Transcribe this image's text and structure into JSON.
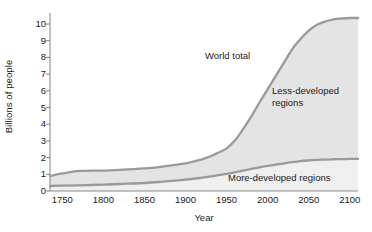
{
  "chart_data": {
    "type": "area",
    "title": "",
    "xlabel": "Year",
    "ylabel": "Billions of people",
    "xlim": [
      1735,
      2110
    ],
    "ylim": [
      0,
      10.6
    ],
    "grid": false,
    "legend_position": "inline-annotations",
    "xticks": [
      1750,
      1800,
      1850,
      1900,
      1950,
      2000,
      2050,
      2100
    ],
    "xtick_labels": [
      "1750",
      "1800",
      "1850",
      "1900",
      "1950",
      "2000",
      "2050",
      "2100"
    ],
    "yticks": [
      0,
      1,
      2,
      3,
      4,
      5,
      6,
      7,
      8,
      9,
      10
    ],
    "ytick_labels": [
      "0",
      "1",
      "2",
      "3",
      "4",
      "5",
      "6",
      "7",
      "8",
      "9",
      "10"
    ],
    "annotations": [
      {
        "text": "World total",
        "x": 1975,
        "y": 7.9
      },
      {
        "text": "Less-developed\nregions",
        "x": 2055,
        "y": 5.9
      },
      {
        "text": "More-developed regions",
        "x": 2020,
        "y": 1.0
      }
    ],
    "x": [
      1735,
      1750,
      1770,
      1800,
      1820,
      1850,
      1870,
      1900,
      1920,
      1930,
      1940,
      1950,
      1960,
      1970,
      1980,
      1990,
      2000,
      2010,
      2020,
      2030,
      2040,
      2050,
      2060,
      2070,
      2080,
      2090,
      2100,
      2110
    ],
    "series": [
      {
        "name": "World total",
        "color": "#9a9a9a",
        "values": [
          0.9,
          1.05,
          1.2,
          1.22,
          1.26,
          1.35,
          1.45,
          1.65,
          1.9,
          2.07,
          2.3,
          2.55,
          3.02,
          3.7,
          4.45,
          5.3,
          6.1,
          6.9,
          7.7,
          8.5,
          9.1,
          9.6,
          9.95,
          10.15,
          10.28,
          10.33,
          10.36,
          10.36
        ]
      },
      {
        "name": "More-developed regions",
        "color": "#9a9a9a",
        "values": [
          0.3,
          0.32,
          0.34,
          0.38,
          0.42,
          0.48,
          0.55,
          0.68,
          0.8,
          0.87,
          0.95,
          1.02,
          1.12,
          1.22,
          1.32,
          1.42,
          1.5,
          1.58,
          1.66,
          1.73,
          1.79,
          1.83,
          1.86,
          1.88,
          1.9,
          1.91,
          1.92,
          1.92
        ]
      },
      {
        "name": "Less-developed regions",
        "color": "#d9d9d9",
        "note": "region between World total and More-developed regions"
      }
    ]
  },
  "axes": {
    "y_title": "Billions of people",
    "x_title": "Year"
  }
}
